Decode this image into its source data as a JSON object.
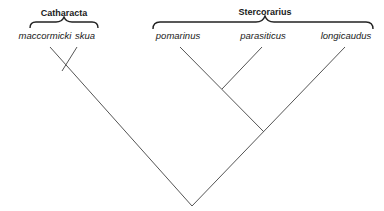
{
  "diagram": {
    "type": "cladogram",
    "groups": [
      {
        "name": "Cataracta",
        "label": "Catharacta",
        "members": [
          "maccormicki",
          "skua"
        ]
      },
      {
        "name": "Stercorarius",
        "label": "Stercorarius",
        "members": [
          "pomarinus",
          "parasiticus",
          "longicaudus"
        ]
      }
    ],
    "taxa": [
      {
        "label": "maccormicki"
      },
      {
        "label": "skua"
      },
      {
        "label": "pomarinus"
      },
      {
        "label": "parasiticus"
      },
      {
        "label": "longicaudus"
      }
    ],
    "tree": "((maccormicki,skua),((pomarinus,parasiticus),longicaudus))",
    "line_color": "#555555"
  }
}
